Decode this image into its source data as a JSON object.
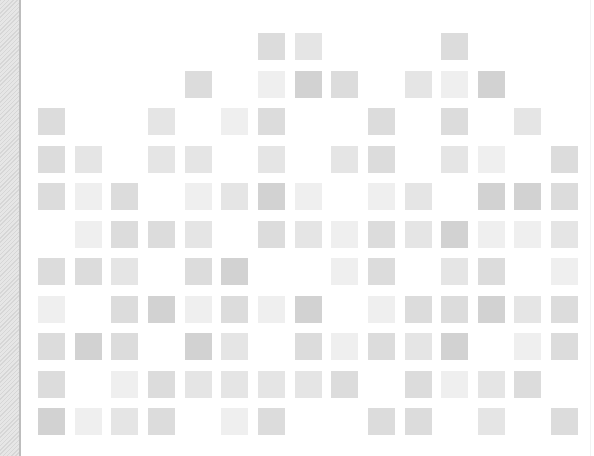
{
  "decor": {
    "left_strip": "hatched-border"
  },
  "grid": {
    "columns_x": [
      38,
      75,
      111,
      148,
      185,
      221,
      258,
      295,
      331,
      368,
      405,
      441,
      478,
      514,
      551
    ],
    "rows_y": [
      33,
      71,
      108,
      146,
      183,
      221,
      258,
      296,
      333,
      371,
      408
    ],
    "cell_size": 27,
    "shades": {
      "1": "#efefef",
      "2": "#e5e5e5",
      "3": "#dcdcdc",
      "4": "#d2d2d2"
    },
    "rows": [
      {
        "row": 0,
        "cells": [
          [
            6,
            3
          ],
          [
            7,
            2
          ],
          [
            11,
            3
          ]
        ]
      },
      {
        "row": 1,
        "cells": [
          [
            4,
            3
          ],
          [
            6,
            1
          ],
          [
            7,
            4
          ],
          [
            8,
            3
          ],
          [
            10,
            2
          ],
          [
            11,
            1
          ],
          [
            12,
            4
          ]
        ]
      },
      {
        "row": 2,
        "cells": [
          [
            0,
            3
          ],
          [
            3,
            2
          ],
          [
            5,
            1
          ],
          [
            6,
            3
          ],
          [
            9,
            3
          ],
          [
            11,
            3
          ],
          [
            13,
            2
          ]
        ]
      },
      {
        "row": 3,
        "cells": [
          [
            0,
            3
          ],
          [
            1,
            2
          ],
          [
            3,
            2
          ],
          [
            4,
            2
          ],
          [
            6,
            2
          ],
          [
            8,
            2
          ],
          [
            9,
            3
          ],
          [
            11,
            2
          ],
          [
            12,
            1
          ],
          [
            14,
            3
          ]
        ]
      },
      {
        "row": 4,
        "cells": [
          [
            0,
            3
          ],
          [
            1,
            1
          ],
          [
            2,
            3
          ],
          [
            4,
            1
          ],
          [
            5,
            2
          ],
          [
            6,
            4
          ],
          [
            7,
            1
          ],
          [
            9,
            1
          ],
          [
            10,
            2
          ],
          [
            12,
            4
          ],
          [
            13,
            4
          ],
          [
            14,
            3
          ]
        ]
      },
      {
        "row": 5,
        "cells": [
          [
            1,
            1
          ],
          [
            2,
            3
          ],
          [
            3,
            3
          ],
          [
            4,
            2
          ],
          [
            6,
            3
          ],
          [
            7,
            2
          ],
          [
            8,
            1
          ],
          [
            9,
            3
          ],
          [
            10,
            2
          ],
          [
            11,
            4
          ],
          [
            12,
            1
          ],
          [
            13,
            1
          ],
          [
            14,
            2
          ]
        ]
      },
      {
        "row": 6,
        "cells": [
          [
            0,
            3
          ],
          [
            1,
            3
          ],
          [
            2,
            2
          ],
          [
            4,
            3
          ],
          [
            5,
            4
          ],
          [
            8,
            1
          ],
          [
            9,
            3
          ],
          [
            11,
            2
          ],
          [
            12,
            3
          ],
          [
            14,
            1
          ]
        ]
      },
      {
        "row": 7,
        "cells": [
          [
            0,
            1
          ],
          [
            2,
            3
          ],
          [
            3,
            4
          ],
          [
            4,
            1
          ],
          [
            5,
            3
          ],
          [
            6,
            1
          ],
          [
            7,
            4
          ],
          [
            9,
            1
          ],
          [
            10,
            3
          ],
          [
            11,
            3
          ],
          [
            12,
            4
          ],
          [
            13,
            2
          ],
          [
            14,
            3
          ]
        ]
      },
      {
        "row": 8,
        "cells": [
          [
            0,
            3
          ],
          [
            1,
            4
          ],
          [
            2,
            3
          ],
          [
            4,
            4
          ],
          [
            5,
            2
          ],
          [
            7,
            3
          ],
          [
            8,
            1
          ],
          [
            9,
            3
          ],
          [
            10,
            2
          ],
          [
            11,
            4
          ],
          [
            13,
            1
          ],
          [
            14,
            3
          ]
        ]
      },
      {
        "row": 9,
        "cells": [
          [
            0,
            3
          ],
          [
            2,
            1
          ],
          [
            3,
            3
          ],
          [
            4,
            2
          ],
          [
            5,
            2
          ],
          [
            6,
            2
          ],
          [
            7,
            2
          ],
          [
            8,
            3
          ],
          [
            10,
            3
          ],
          [
            11,
            1
          ],
          [
            12,
            2
          ],
          [
            13,
            3
          ]
        ]
      },
      {
        "row": 10,
        "cells": [
          [
            0,
            4
          ],
          [
            1,
            1
          ],
          [
            2,
            2
          ],
          [
            3,
            3
          ],
          [
            5,
            1
          ],
          [
            6,
            3
          ],
          [
            9,
            3
          ],
          [
            10,
            3
          ],
          [
            12,
            2
          ],
          [
            14,
            3
          ]
        ]
      }
    ]
  }
}
